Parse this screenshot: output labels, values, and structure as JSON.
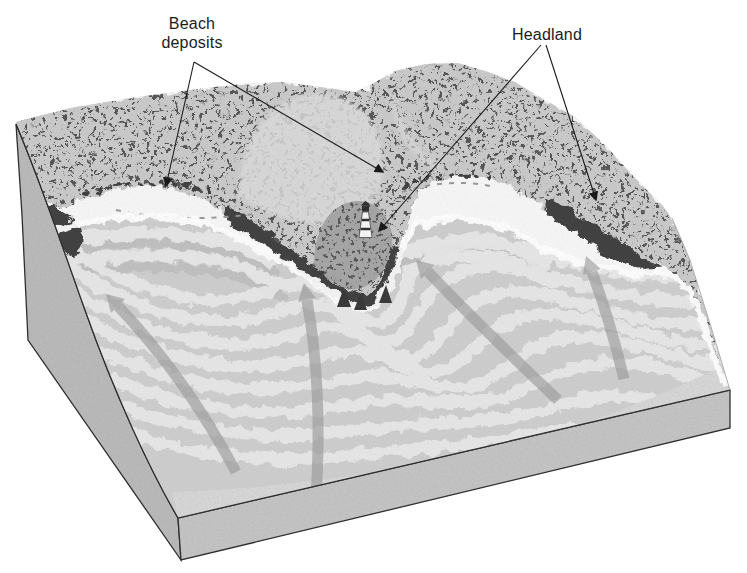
{
  "diagram": {
    "labels": {
      "beach_deposits": "Beach deposits",
      "headland": "Headland"
    },
    "icons": [
      "lighthouse-icon",
      "wave-direction-arrow",
      "sea-stack",
      "leader-arrowhead"
    ],
    "counts": {
      "wave_direction_arrows": 4,
      "beach_deposits_pointers": 2,
      "headland_pointers": 2
    },
    "colors": {
      "background": "#ffffff",
      "text": "#1c1c1c",
      "leader_line": "#1a1a1a",
      "edge_line": "#2b2b2b",
      "left_face": "#bdbdbd",
      "front_face": "#c8c8c8",
      "water_base": "#cfcfcf",
      "wave_crest": "#e9e9e9",
      "wave_trough": "#c1c1c1",
      "nearshore_calm": "#dedede",
      "beach": "#f8f8f8",
      "foam": "#ffffff",
      "land": "#cbcbcb",
      "land_dome": "#dcdcdc",
      "vegetation": "#404040",
      "headland_knoll": "#a6a6a6",
      "sea_stack": "#383838",
      "wave_arrow": "#9a9a9a",
      "lighthouse_white": "#f7f7f7",
      "lighthouse_dark": "#2f2f2f"
    }
  }
}
